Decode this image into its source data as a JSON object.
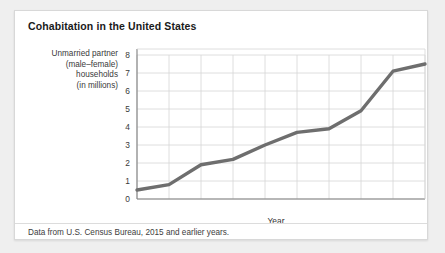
{
  "card": {
    "title": "Cohabitation in the United States",
    "caption": "Data from U.S. Census Bureau, 2015 and earlier years."
  },
  "axis_label_lines": [
    "Unmarried partner",
    "(male–female)",
    "households",
    "(in millions)"
  ],
  "colors": {
    "line": "#6e6e6e",
    "grid": "#d5d5d5",
    "axis": "#808080",
    "card_background": "#ffffff",
    "page_background": "#efefef",
    "text": "#333333"
  },
  "chart_data": {
    "type": "line",
    "title": "Cohabitation in the United States",
    "xlabel": "Year",
    "ylabel": "Unmarried partner (male–female) households (in millions)",
    "x": [
      1970,
      1975,
      1980,
      1985,
      1990,
      1995,
      2000,
      2005,
      2010,
      2015
    ],
    "values": [
      0.5,
      0.8,
      1.9,
      2.2,
      3.0,
      3.7,
      3.9,
      4.9,
      7.1,
      7.5
    ],
    "xtick_labels": [
      "1970",
      "1975",
      "1980",
      "1985",
      "1990",
      "1995",
      "2000",
      "2005",
      "2010",
      "2015"
    ],
    "ytick_labels": [
      "0",
      "1",
      "2",
      "3",
      "4",
      "5",
      "6",
      "7",
      "8"
    ],
    "xlim": [
      1970,
      2015
    ],
    "ylim": [
      0,
      8
    ],
    "grid": true,
    "legend": "none",
    "series": [
      {
        "name": "Unmarried partner (male–female) households",
        "values": [
          0.5,
          0.8,
          1.9,
          2.2,
          3.0,
          3.7,
          3.9,
          4.9,
          7.1,
          7.5
        ]
      }
    ]
  }
}
